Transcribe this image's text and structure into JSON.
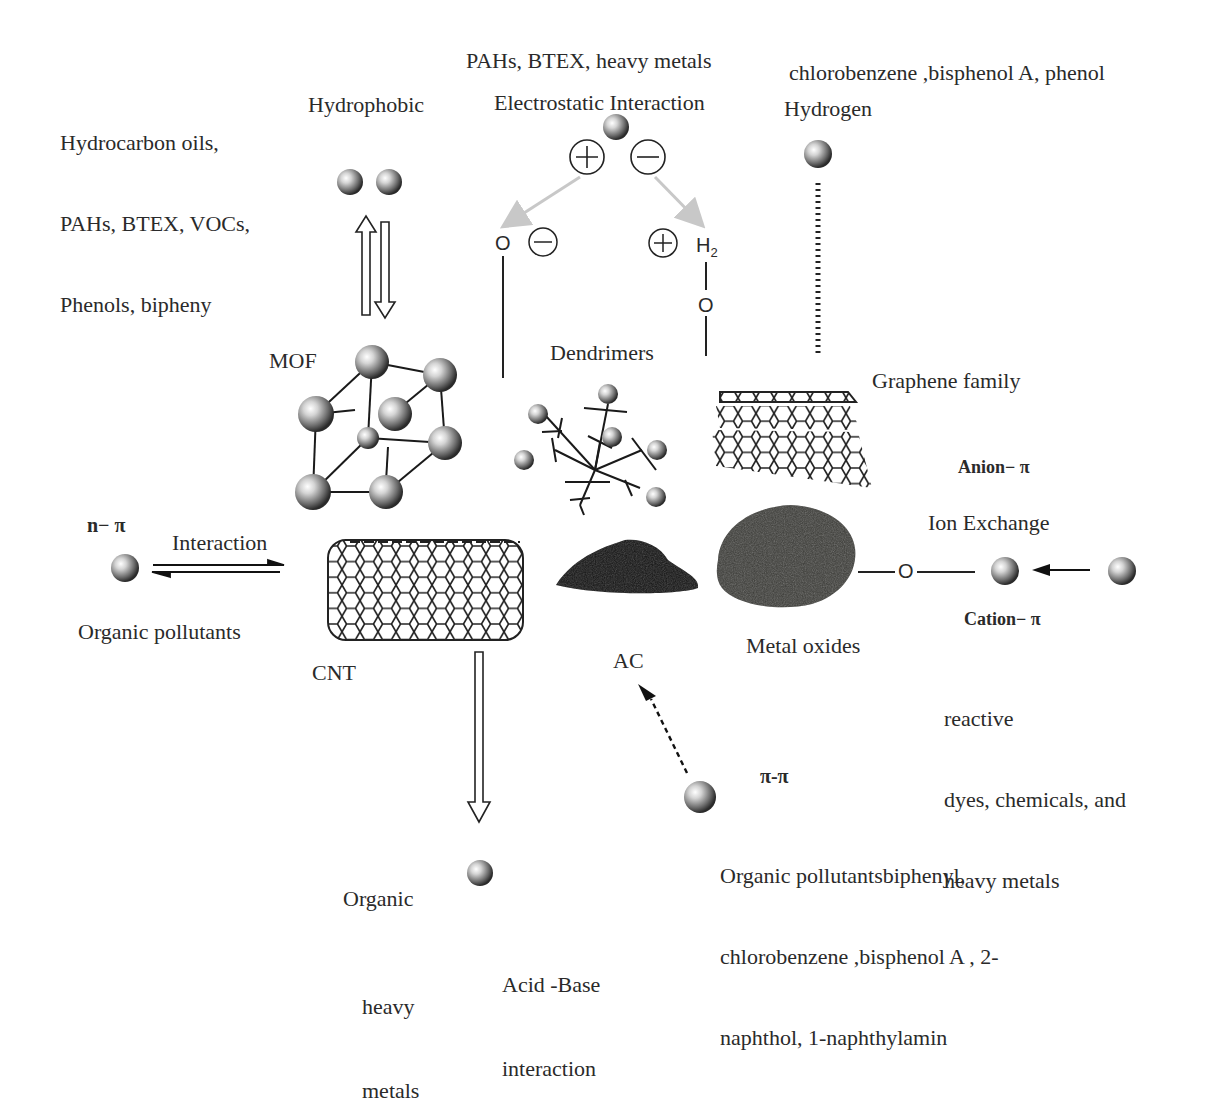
{
  "figure": {
    "interactions": {
      "hydrophobic": {
        "title": "Hydrophobic",
        "pollutants": [
          "Hydrocarbon oils,",
          "PAHs, BTEX, VOCs,",
          "Phenols, bipheny"
        ]
      },
      "electrostatic": {
        "title": "Electrostatic Interaction",
        "pollutants": "PAHs, BTEX, heavy metals",
        "charges": {
          "plus": "+",
          "minus": "−"
        },
        "left_group": "O",
        "right_group_h": "H",
        "right_group_sub": "2",
        "right_group_o": "O"
      },
      "hydrogen": {
        "title": "Hydrogen",
        "pollutants": "chlorobenzene ,bisphenol A, phenol"
      },
      "n_pi": {
        "title": "n− π",
        "arrow_label": "Interaction",
        "pollutants": "Organic pollutants"
      },
      "anion_pi": {
        "title": "Anion− π"
      },
      "ion_exchange": {
        "title": "Ion Exchange",
        "linker": "O",
        "subtitle": "Cation− π",
        "pollutants": [
          "reactive",
          "dyes, chemicals, and",
          "heavy metals"
        ]
      },
      "pi_pi": {
        "title": "π-π",
        "pollutants": [
          "Organic pollutantsbiphenyl,",
          "chlorobenzene ,bisphenol A , 2-",
          "naphthol, 1-naphthylamin"
        ]
      },
      "acid_base": {
        "title": [
          "Acid -Base",
          "interaction"
        ],
        "pollutants": [
          "Organic",
          "heavy",
          "metals"
        ]
      }
    },
    "adsorbents": {
      "mof": "MOF",
      "dendrimers": "Dendrimers",
      "graphene": "Graphene family",
      "cnt": "CNT",
      "ac": "AC",
      "metal_oxides": "Metal oxides"
    },
    "colors": {
      "text": "#2a2a2a",
      "line": "#1a1a1a",
      "grey_arrow": "#c8c8c8",
      "powder_ac": "#111111",
      "powder_metal": "#3a3a36"
    }
  }
}
